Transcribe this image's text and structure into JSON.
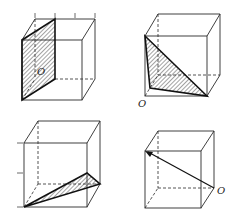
{
  "figures": [
    {
      "id": "top-left",
      "label": "O",
      "shape": "cube",
      "highlight": "shaded diagonal parallelogram section"
    },
    {
      "id": "top-right",
      "label": "O",
      "shape": "cube",
      "highlight": "shaded triangle from top-left-front vertex"
    },
    {
      "id": "bottom-left",
      "label": "",
      "shape": "cube",
      "highlight": "shaded thin triangle from bottom-left corner"
    },
    {
      "id": "bottom-right",
      "label": "O",
      "shape": "cube",
      "highlight": "arrow vector from O to top-left-front vertex"
    }
  ],
  "colors": {
    "line": "#2a2a2a",
    "background": "#ffffff"
  }
}
